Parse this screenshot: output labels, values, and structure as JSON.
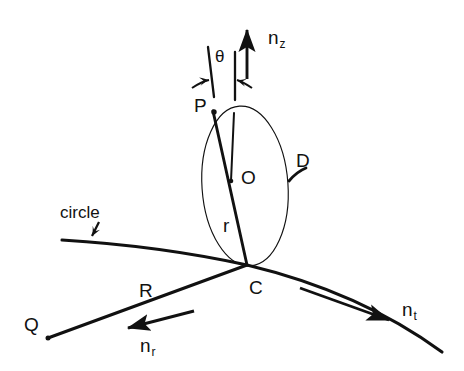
{
  "figure": {
    "type": "geometry-diagram",
    "background_color": "#ffffff",
    "stroke_color": "#111111",
    "width": 464,
    "height": 371
  },
  "labels": {
    "point_p": "P",
    "point_o": "O",
    "point_c": "C",
    "point_q": "Q",
    "disk_d": "D",
    "radius_r": "r",
    "segment_r": "R",
    "circle": "circle",
    "theta": "θ"
  },
  "vectors": {
    "n_z": {
      "name": "n",
      "subscript": "z"
    },
    "n_t": {
      "name": "n",
      "subscript": "t"
    },
    "n_r": {
      "name": "n",
      "subscript": "r"
    }
  },
  "geometry": {
    "ellipse_d": {
      "cx": 245,
      "cy": 186,
      "rx": 43,
      "ry": 80,
      "rotation": -4
    },
    "point_p": {
      "x": 213,
      "y": 110
    },
    "point_o": {
      "x": 232,
      "y": 180
    },
    "point_c": {
      "x": 247,
      "y": 265
    },
    "point_q": {
      "x": 48,
      "y": 338
    },
    "circle_arc": "M 62 240 Q 160 246 247 265 Q 360 292 442 352",
    "chord_pc": "M 213 111 L 247 265",
    "axis_oc": "M 233 112 L 231 180",
    "line_qc": "M 48 338 L 247 265"
  }
}
